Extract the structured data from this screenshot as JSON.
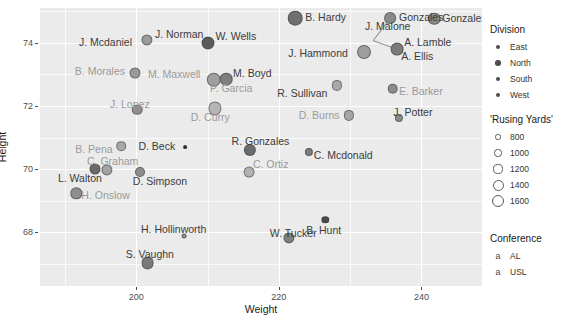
{
  "chart_data": {
    "type": "scatter",
    "title": "",
    "xlabel": "Weight",
    "ylabel": "Height",
    "xlim": [
      186.5,
      248.5
    ],
    "ylim": [
      66.3,
      75.1
    ],
    "xticks": [
      200,
      220,
      240
    ],
    "yticks": [
      74,
      72,
      70,
      68
    ],
    "xminor": [
      190,
      210,
      230,
      240
    ],
    "grid": true,
    "legend_position": "right",
    "size_variable": "'Rusing Yards'",
    "size_breaks": [
      800,
      1000,
      1200,
      1400,
      1600
    ],
    "color_variable": "Division",
    "color_levels": [
      "East",
      "North",
      "South",
      "West"
    ],
    "label_variable": "Conference",
    "label_levels": [
      "AL",
      "USL"
    ],
    "points": [
      {
        "label": "B. Hardy",
        "x": 222.3,
        "y": 74.78,
        "r": 7.3,
        "color": "#6f6f6f",
        "conf": "AL",
        "lx": 10,
        "ly": -1
      },
      {
        "label": "Gonzales",
        "x": 235.6,
        "y": 74.78,
        "r": 5.9,
        "color": "#8a8a8a",
        "conf": "AL",
        "lx": 9,
        "ly": -1
      },
      {
        "label": "Gonzalez",
        "x": 241.8,
        "y": 74.75,
        "r": 6.2,
        "color": "#8a8a8a",
        "conf": "AL",
        "lx": 8,
        "ly": -1
      },
      {
        "label": "J. Norman",
        "x": 201.5,
        "y": 74.1,
        "r": 5.6,
        "color": "#9b9b9b",
        "conf": "AL",
        "lx": 8,
        "ly": -6
      },
      {
        "label": "W. Wells",
        "x": 210.0,
        "y": 73.98,
        "r": 6.5,
        "color": "#5c5c5c",
        "conf": "AL",
        "lx": 8,
        "ly": -7
      },
      {
        "label": "J. Mcdaniel",
        "x": 201.5,
        "y": 74.1,
        "r": 0,
        "color": "#9b9b9b",
        "conf": "AL",
        "lx": -68,
        "ly": 2
      },
      {
        "label": "J. Malone",
        "x": 233.2,
        "y": 74.08,
        "r": 0,
        "color": "#8a8a8a",
        "conf": "AL",
        "lx": -8,
        "ly": -14
      },
      {
        "label": "A. Lamble",
        "x": 236.6,
        "y": 73.8,
        "r": 6.4,
        "color": "#7a7a7a",
        "conf": "AL",
        "lx": 7,
        "ly": -7
      },
      {
        "label": "J. Hammond",
        "x": 232.0,
        "y": 73.7,
        "r": 7.0,
        "color": "#9d9d9d",
        "conf": "AL",
        "lx": -76,
        "ly": 1
      },
      {
        "label": "A. Ellis",
        "x": 236.6,
        "y": 73.8,
        "r": 0,
        "color": "#7a7a7a",
        "conf": "AL",
        "lx": 4,
        "ly": 7
      },
      {
        "label": "B. Morales",
        "x": 199.8,
        "y": 73.05,
        "r": 5.5,
        "color": "#9a9a9a",
        "conf": "USL",
        "lx": -60,
        "ly": -2
      },
      {
        "label": "M. Maxwell",
        "x": 210.9,
        "y": 72.82,
        "r": 7.2,
        "color": "#a0a0a0",
        "conf": "USL",
        "lx": -66,
        "ly": -6
      },
      {
        "label": "M. Boyd",
        "x": 212.6,
        "y": 72.85,
        "r": 6.3,
        "color": "#7e7e7e",
        "conf": "AL",
        "lx": 7,
        "ly": -6
      },
      {
        "label": "P. Garcia",
        "x": 210.9,
        "y": 72.82,
        "r": 0,
        "color": "#a0a0a0",
        "conf": "USL",
        "lx": -4,
        "ly": 8
      },
      {
        "label": "R. Sullivan",
        "x": 228.2,
        "y": 72.65,
        "r": 5.1,
        "color": "#a8a8a8",
        "conf": "AL",
        "lx": -60,
        "ly": 8
      },
      {
        "label": "E. Barker",
        "x": 236.0,
        "y": 72.55,
        "r": 5.3,
        "color": "#8b8b8b",
        "conf": "USL",
        "lx": 6,
        "ly": 2
      },
      {
        "label": "J. Lopez",
        "x": 200.1,
        "y": 71.88,
        "r": 5.3,
        "color": "#8f8f8f",
        "conf": "USL",
        "lx": -27,
        "ly": -6
      },
      {
        "label": "D. Curry",
        "x": 211.0,
        "y": 71.92,
        "r": 6.6,
        "color": "#b5b5b5",
        "conf": "USL",
        "lx": -24,
        "ly": 9
      },
      {
        "label": "D. Burns",
        "x": 229.8,
        "y": 71.7,
        "r": 5.1,
        "color": "#a5a5a5",
        "conf": "USL",
        "lx": -50,
        "ly": 0
      },
      {
        "label": "J. Potter",
        "x": 236.9,
        "y": 71.62,
        "r": 4.1,
        "color": "#8b8b8b",
        "conf": "AL",
        "lx": -6,
        "ly": -6
      },
      {
        "label": "B. Pena",
        "x": 197.9,
        "y": 70.72,
        "r": 4.8,
        "color": "#a7a7a7",
        "conf": "USL",
        "lx": -46,
        "ly": 3
      },
      {
        "label": "D. Beck",
        "x": 206.9,
        "y": 70.7,
        "r": 1.9,
        "color": "#2e2e2e",
        "conf": "AL",
        "lx": -47,
        "ly": -1
      },
      {
        "label": "R. Gonzales",
        "x": 215.9,
        "y": 70.62,
        "r": 6.1,
        "color": "#6c6c6c",
        "conf": "AL",
        "lx": -18,
        "ly": -9
      },
      {
        "label": "C. Mcdonald",
        "x": 224.2,
        "y": 70.55,
        "r": 4.1,
        "color": "#7b7b7b",
        "conf": "AL",
        "lx": 5,
        "ly": 3
      },
      {
        "label": "C. Graham",
        "x": 195.9,
        "y": 69.98,
        "r": 5.6,
        "color": "#a3a3a3",
        "conf": "USL",
        "lx": -20,
        "ly": -9
      },
      {
        "label": "L. Walton",
        "x": 194.2,
        "y": 70.0,
        "r": 5.5,
        "color": "#6a6a6a",
        "conf": "AL",
        "lx": -37,
        "ly": 9
      },
      {
        "label": "D. Simpson",
        "x": 200.5,
        "y": 69.92,
        "r": 5.0,
        "color": "#8d8d8d",
        "conf": "AL",
        "lx": -7,
        "ly": 9
      },
      {
        "label": "C. Ortiz",
        "x": 215.8,
        "y": 69.9,
        "r": 5.4,
        "color": "#b2b2b2",
        "conf": "USL",
        "lx": 4,
        "ly": -8
      },
      {
        "label": "H. Onslow",
        "x": 191.6,
        "y": 69.23,
        "r": 5.7,
        "color": "#8e8e8e",
        "conf": "USL",
        "lx": 5,
        "ly": 2
      },
      {
        "label": "B. Hunt",
        "x": 226.5,
        "y": 68.4,
        "r": 3.7,
        "color": "#4a4a4a",
        "conf": "AL",
        "lx": -19,
        "ly": 10
      },
      {
        "label": "H. Hollinworth",
        "x": 206.7,
        "y": 67.87,
        "r": 2.4,
        "color": "#8d8d8d",
        "conf": "AL",
        "lx": -43,
        "ly": -7
      },
      {
        "label": "W. Tucker",
        "x": 221.4,
        "y": 67.82,
        "r": 5.6,
        "color": "#7f7f7f",
        "conf": "AL",
        "lx": -19,
        "ly": -5
      },
      {
        "label": "S. Vaughn",
        "x": 201.6,
        "y": 67.02,
        "r": 6.4,
        "color": "#7a7a7a",
        "conf": "AL",
        "lx": -22,
        "ly": -9
      }
    ]
  },
  "axes": {
    "y_title": "Height",
    "x_title": "Weight",
    "y_tick_labels": [
      "74",
      "72",
      "70",
      "68"
    ],
    "x_tick_labels": [
      "200",
      "220",
      "240"
    ]
  },
  "legends": {
    "division": {
      "title": "Division",
      "items": [
        {
          "label": "East",
          "size": 2.0,
          "color": "#4d4d4d"
        },
        {
          "label": "North",
          "size": 2.7,
          "color": "#4d4d4d"
        },
        {
          "label": "South",
          "size": 2.4,
          "color": "#4d4d4d"
        },
        {
          "label": "West",
          "size": 1.9,
          "color": "#4d4d4d"
        }
      ]
    },
    "size": {
      "title": "'Rusing Yards'",
      "items": [
        {
          "label": "800",
          "r": 2.6
        },
        {
          "label": "1000",
          "r": 3.6
        },
        {
          "label": "1200",
          "r": 4.6
        },
        {
          "label": "1400",
          "r": 5.5
        },
        {
          "label": "1600",
          "r": 6.4
        }
      ]
    },
    "conference": {
      "title": "Conference",
      "items": [
        {
          "label": "AL",
          "glyph": "a"
        },
        {
          "label": "USL",
          "glyph": "a"
        }
      ]
    }
  }
}
